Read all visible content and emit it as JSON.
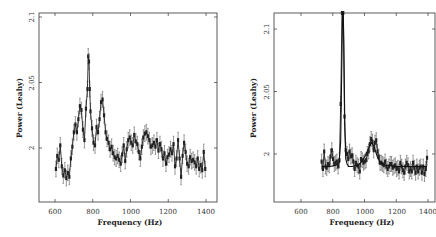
{
  "chart_data": [
    {
      "type": "line",
      "title": "",
      "xlabel": "Frequency (Hz)",
      "ylabel": "Power (Leahy)",
      "xlim": [
        520,
        1460
      ],
      "ylim": [
        1.959,
        2.103
      ],
      "xticks": [
        600,
        800,
        1000,
        1200,
        1400
      ],
      "yticks": [
        2,
        2.05,
        2.1
      ],
      "ytick_labels": [
        "2",
        "2.05",
        "2.1"
      ],
      "grid": false,
      "legend": null,
      "series": [
        {
          "name": "data with error bars",
          "x": [
            605,
            612,
            620,
            628,
            636,
            644,
            652,
            660,
            668,
            676,
            684,
            692,
            700,
            708,
            716,
            724,
            732,
            740,
            748,
            756,
            764,
            772,
            776,
            780,
            784,
            788,
            796,
            804,
            812,
            820,
            828,
            836,
            844,
            852,
            860,
            868,
            876,
            884,
            892,
            900,
            908,
            916,
            924,
            932,
            940,
            948,
            956,
            964,
            972,
            980,
            988,
            996,
            1004,
            1012,
            1020,
            1028,
            1036,
            1044,
            1052,
            1060,
            1068,
            1076,
            1084,
            1092,
            1100,
            1108,
            1116,
            1124,
            1132,
            1140,
            1148,
            1156,
            1164,
            1172,
            1180,
            1188,
            1196,
            1204,
            1212,
            1220,
            1228,
            1236,
            1244,
            1252,
            1260,
            1268,
            1276,
            1284,
            1292,
            1300,
            1308,
            1316,
            1324,
            1332,
            1340,
            1348,
            1356,
            1364,
            1372,
            1380,
            1388,
            1396
          ],
          "y": [
            1.984,
            1.994,
            1.991,
            2.002,
            1.986,
            1.979,
            1.983,
            1.977,
            1.981,
            1.978,
            1.992,
            2.001,
            2.012,
            2.018,
            2.012,
            2.022,
            2.032,
            2.029,
            2.014,
            2.006,
            2.03,
            2.045,
            2.07,
            2.066,
            2.045,
            2.028,
            2.015,
            2.004,
            2.002,
            2.016,
            2.012,
            2.022,
            2.035,
            2.037,
            2.025,
            2.012,
            2.007,
            2.004,
            1.999,
            2.001,
            1.996,
            1.993,
            1.992,
            1.994,
            1.991,
            1.988,
            1.995,
            2.002,
            1.99,
            1.999,
            2.006,
            2.008,
            2.004,
            2.002,
            2.01,
            2.005,
            2.003,
            1.997,
            1.992,
            2.001,
            2.008,
            2.011,
            2.012,
            2.009,
            2.006,
            2.001,
            2.002,
            2.004,
            2.001,
            2.006,
            1.998,
            2.003,
            1.999,
            1.992,
            1.996,
            1.988,
            1.993,
            1.995,
            1.999,
            1.996,
            2.003,
            1.986,
            1.992,
            2.006,
            1.992,
            1.978,
            1.994,
            2.004,
            1.997,
            1.988,
            1.986,
            1.993,
            1.99,
            1.991,
            1.989,
            1.986,
            1.992,
            1.984,
            1.987,
            1.983,
            1.997,
            1.984
          ],
          "error": 0.006
        }
      ]
    },
    {
      "type": "line",
      "title": "",
      "xlabel": "Frequency (Hz)",
      "ylabel": "Power (Leahy)",
      "xlim": [
        770,
        1800
      ],
      "ylim": [
        1.962,
        2.113
      ],
      "xticks": [
        600,
        800,
        1000,
        1200,
        1400
      ],
      "yticks": [
        2,
        2.05,
        2.1
      ],
      "ytick_labels": [
        "2",
        "2.05",
        "2.1"
      ],
      "grid": false,
      "legend": null,
      "series": [
        {
          "name": "data with error bars",
          "x": [
            730,
            738,
            746,
            754,
            762,
            770,
            778,
            786,
            794,
            802,
            810,
            818,
            826,
            834,
            842,
            850,
            858,
            866,
            874,
            882,
            890,
            898,
            906,
            914,
            922,
            930,
            938,
            946,
            954,
            962,
            970,
            978,
            986,
            994,
            1002,
            1010,
            1018,
            1026,
            1034,
            1042,
            1050,
            1058,
            1066,
            1074,
            1082,
            1090,
            1098,
            1106,
            1114,
            1122,
            1130,
            1138,
            1146,
            1154,
            1162,
            1170,
            1178,
            1186,
            1194,
            1202,
            1210,
            1218,
            1226,
            1234,
            1242,
            1250,
            1258,
            1266,
            1274,
            1282,
            1290,
            1298,
            1306,
            1314,
            1322,
            1330,
            1338,
            1346,
            1354,
            1362,
            1370,
            1378,
            1386,
            1394
          ],
          "y": [
            1.994,
            1.988,
            2.002,
            1.99,
            1.989,
            1.992,
            1.991,
            1.998,
            2.003,
            1.996,
            1.992,
            1.993,
            1.994,
            1.99,
            1.995,
            2.04,
            2.14,
            2.14,
            2.03,
            2.003,
            2.0,
            1.996,
            2.002,
            1.998,
            1.999,
            1.994,
            1.988,
            1.993,
            1.991,
            1.99,
            1.986,
            1.996,
            1.995,
            1.993,
            1.994,
            1.995,
            2.0,
            2.002,
            2.008,
            2.012,
            2.01,
            2.003,
            2.009,
            2.011,
            2.002,
            1.998,
            1.993,
            1.993,
            1.992,
            1.991,
            1.994,
            1.99,
            1.988,
            1.99,
            1.992,
            1.992,
            1.989,
            1.99,
            1.991,
            1.988,
            1.989,
            1.986,
            1.993,
            1.99,
            1.987,
            1.985,
            1.99,
            1.993,
            1.991,
            1.986,
            1.988,
            1.986,
            1.993,
            1.989,
            1.985,
            1.99,
            1.986,
            1.989,
            1.99,
            1.985,
            1.99,
            1.984,
            1.988,
            1.997
          ],
          "error": 0.006
        },
        {
          "name": "model fit",
          "x": [
            730,
            780,
            820,
            840,
            850,
            858,
            862,
            866,
            870,
            876,
            882,
            890,
            900,
            920,
            960,
            990,
            1010,
            1030,
            1045,
            1060,
            1080,
            1100,
            1130,
            1200,
            1300,
            1394
          ],
          "y": [
            1.99,
            1.99,
            1.991,
            1.993,
            2.01,
            2.08,
            2.14,
            2.14,
            2.09,
            2.02,
            1.996,
            1.992,
            1.99,
            1.99,
            1.991,
            1.995,
            2.0,
            2.006,
            2.009,
            2.006,
            1.998,
            1.993,
            1.991,
            1.99,
            1.99,
            1.99
          ]
        }
      ]
    }
  ],
  "plots": [
    {
      "xlabel": "Frequency (Hz)",
      "ylabel": "Power (Leahy)",
      "xtick_labels": [
        "600",
        "800",
        "1000",
        "1200",
        "1400"
      ],
      "ytick_labels": [
        "2",
        "2.05",
        "2.1"
      ]
    },
    {
      "xlabel": "Frequency (Hz)",
      "ylabel": "Power (Leahy)",
      "xtick_labels": [
        "600",
        "800",
        "1000",
        "1200",
        "1400"
      ],
      "ytick_labels": [
        "2",
        "2.05",
        "2.1"
      ]
    }
  ]
}
